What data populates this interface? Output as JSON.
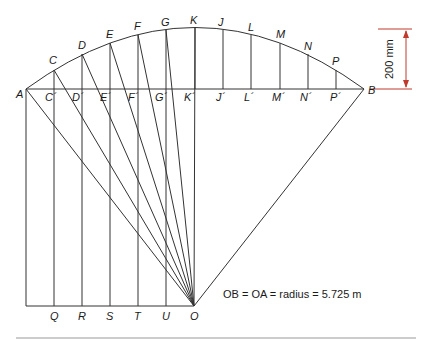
{
  "diagram": {
    "type": "arc-offsets-from-chord",
    "colors": {
      "line": "#333333",
      "dimension": "#c0392b",
      "rule": "#999999"
    },
    "points": {
      "A": {
        "label": "A",
        "x": 26,
        "y": 89
      },
      "B": {
        "label": "B",
        "x": 364,
        "y": 89
      },
      "O": {
        "label": "O",
        "x": 194,
        "y": 306
      }
    },
    "arc_points": [
      {
        "label": "C",
        "x": 54,
        "y": 70,
        "foot": "C´"
      },
      {
        "label": "D",
        "x": 82,
        "y": 54,
        "foot": "D´"
      },
      {
        "label": "E",
        "x": 110,
        "y": 43,
        "foot": "E´"
      },
      {
        "label": "F",
        "x": 138,
        "y": 35,
        "foot": "F´"
      },
      {
        "label": "G",
        "x": 166,
        "y": 30,
        "foot": "G´"
      },
      {
        "label": "K",
        "x": 195,
        "y": 28,
        "foot": "K´"
      },
      {
        "label": "J",
        "x": 223,
        "y": 30,
        "foot": "J´"
      },
      {
        "label": "L",
        "x": 251,
        "y": 35,
        "foot": "L´"
      },
      {
        "label": "M",
        "x": 280,
        "y": 43,
        "foot": "M´"
      },
      {
        "label": "N",
        "x": 308,
        "y": 54,
        "foot": "N´"
      },
      {
        "label": "P",
        "x": 336,
        "y": 70,
        "foot": "P´"
      }
    ],
    "bottom_points": [
      {
        "label": "Q",
        "x": 54
      },
      {
        "label": "R",
        "x": 82
      },
      {
        "label": "S",
        "x": 110
      },
      {
        "label": "T",
        "x": 138
      },
      {
        "label": "U",
        "x": 166
      },
      {
        "label": "O",
        "x": 194
      }
    ],
    "labels": {
      "A": "A",
      "B": "B",
      "O": "O",
      "C": "C",
      "D": "D",
      "E": "E",
      "F": "F",
      "G": "G",
      "K": "K",
      "J": "J",
      "L": "L",
      "M": "M",
      "N": "N",
      "P": "P",
      "C_": "C´",
      "D_": "D´",
      "E_": "E´",
      "F_": "F´",
      "G_": "G´",
      "K_": "K´",
      "J_": "J´",
      "L_": "L´",
      "M_": "M´",
      "N_": "N´",
      "P_": "P´",
      "Q": "Q",
      "R": "R",
      "S": "S",
      "T": "T",
      "U": "U",
      "O_bottom": "O"
    },
    "dimension": {
      "text": "200 mm"
    },
    "caption": {
      "text": "OB = OA = radius = 5.725 m"
    }
  }
}
